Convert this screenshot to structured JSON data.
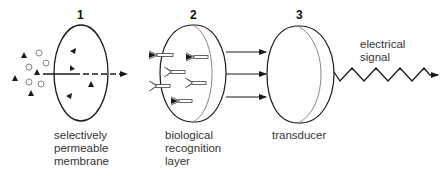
{
  "diagram": {
    "type": "biosensor-schematic",
    "colors": {
      "stroke": "#1a1a1a",
      "text": "#333333",
      "background": "#ffffff",
      "receptor_stroke": "#555555"
    },
    "stages": [
      {
        "number": "1",
        "label_lines": [
          "selectively",
          "permeable",
          "membrane"
        ]
      },
      {
        "number": "2",
        "label_lines": [
          "biological",
          "recognition",
          "layer"
        ]
      },
      {
        "number": "3",
        "label_lines": [
          "transducer"
        ]
      }
    ],
    "output": {
      "label_lines": [
        "electrical",
        "signal"
      ]
    },
    "legend_shapes": {
      "analyte": "filled-triangle",
      "interferent": "open-circle",
      "receptor": "Y-shaped-receptor"
    }
  }
}
